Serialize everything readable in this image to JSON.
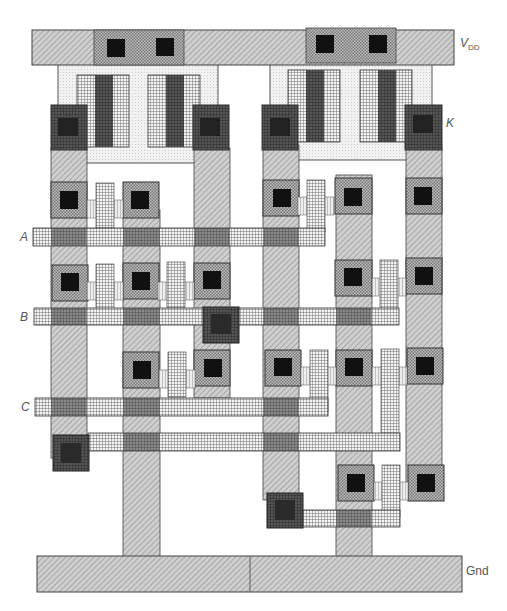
{
  "diagram": {
    "type": "VLSI mask layout",
    "labels": {
      "vdd": "V",
      "vdd_sub": "DD",
      "k": "K",
      "a": "A",
      "b": "B",
      "c": "C",
      "gnd": "Gnd"
    },
    "layers": {
      "metal": {
        "color": "#c8c8c8",
        "pattern": "diagonal-hatch"
      },
      "poly": {
        "color": "#e8e8e8",
        "pattern": "crosshatch-grid"
      },
      "diffusion": {
        "color": "#d0d0d0",
        "pattern": "dense-dot"
      },
      "contact": {
        "color": "#111111",
        "pattern": "solid"
      },
      "nwell": {
        "color": "#f0f0f0",
        "pattern": "light-dot"
      }
    },
    "rails": [
      {
        "name": "VDD",
        "x": 32,
        "y": 30,
        "w": 422,
        "h": 35
      },
      {
        "name": "Gnd",
        "x": 37,
        "y": 556,
        "w": 425,
        "h": 36
      }
    ],
    "inputs": [
      "A",
      "B",
      "C"
    ],
    "output": "K"
  }
}
